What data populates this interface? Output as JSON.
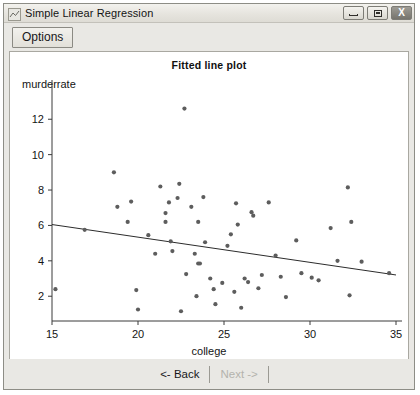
{
  "window": {
    "title": "Simple Linear Regression",
    "icon": "app-icon",
    "controls": [
      {
        "name": "minimize-button",
        "glyph": "minimize-icon"
      },
      {
        "name": "maximize-button",
        "glyph": "maximize-icon"
      },
      {
        "name": "close-button",
        "glyph": "close-icon",
        "label": "X"
      }
    ]
  },
  "toolbar": {
    "options_label": "Options"
  },
  "footer": {
    "back_label": "<- Back",
    "next_label": "Next ->",
    "next_disabled": true
  },
  "chart_data": {
    "type": "scatter",
    "title": "Fitted line plot",
    "xlabel": "college",
    "ylabel": "murderrate",
    "xlim": [
      15,
      35
    ],
    "ylim": [
      0.6,
      13.2
    ],
    "xticks": [
      15,
      20,
      25,
      30,
      35
    ],
    "yticks": [
      2,
      4,
      6,
      8,
      10,
      12
    ],
    "grid": false,
    "legend": null,
    "marker_color": "#5d5d5d",
    "line_color": "#2c2c2c",
    "fit_line": {
      "name": "regression-line",
      "x": [
        15.0,
        35.0
      ],
      "y": [
        6.05,
        3.2
      ]
    },
    "points": [
      [
        15.2,
        2.4
      ],
      [
        16.9,
        5.75
      ],
      [
        18.6,
        9.0
      ],
      [
        18.8,
        7.05
      ],
      [
        19.4,
        6.2
      ],
      [
        19.6,
        7.35
      ],
      [
        19.9,
        2.35
      ],
      [
        20.0,
        1.25
      ],
      [
        20.6,
        5.45
      ],
      [
        21.0,
        4.4
      ],
      [
        21.3,
        8.2
      ],
      [
        21.6,
        6.7
      ],
      [
        21.6,
        6.2
      ],
      [
        21.8,
        7.3
      ],
      [
        21.9,
        5.1
      ],
      [
        22.0,
        4.55
      ],
      [
        22.3,
        7.55
      ],
      [
        22.4,
        8.35
      ],
      [
        22.5,
        1.15
      ],
      [
        22.7,
        12.6
      ],
      [
        22.8,
        3.25
      ],
      [
        23.1,
        7.05
      ],
      [
        23.3,
        4.4
      ],
      [
        23.4,
        2.0
      ],
      [
        23.5,
        6.2
      ],
      [
        23.5,
        3.85
      ],
      [
        23.6,
        3.85
      ],
      [
        23.8,
        7.6
      ],
      [
        23.9,
        5.05
      ],
      [
        24.2,
        3.0
      ],
      [
        24.4,
        2.4
      ],
      [
        24.5,
        1.55
      ],
      [
        24.9,
        2.75
      ],
      [
        25.2,
        4.85
      ],
      [
        25.4,
        5.5
      ],
      [
        25.6,
        2.25
      ],
      [
        25.7,
        7.25
      ],
      [
        25.8,
        6.05
      ],
      [
        26.0,
        1.35
      ],
      [
        26.2,
        3.0
      ],
      [
        26.4,
        2.8
      ],
      [
        26.6,
        6.75
      ],
      [
        26.7,
        6.55
      ],
      [
        27.0,
        2.45
      ],
      [
        27.2,
        3.2
      ],
      [
        27.6,
        7.3
      ],
      [
        28.0,
        4.3
      ],
      [
        28.3,
        3.1
      ],
      [
        28.6,
        1.95
      ],
      [
        29.2,
        5.15
      ],
      [
        29.5,
        3.3
      ],
      [
        30.1,
        3.05
      ],
      [
        30.5,
        2.9
      ],
      [
        31.2,
        5.85
      ],
      [
        31.6,
        4.0
      ],
      [
        32.2,
        8.15
      ],
      [
        32.3,
        2.05
      ],
      [
        32.4,
        6.2
      ],
      [
        33.0,
        3.95
      ],
      [
        34.6,
        3.3
      ]
    ]
  }
}
